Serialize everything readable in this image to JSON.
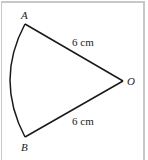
{
  "diagram": {
    "type": "sector",
    "points": {
      "A": "A",
      "O": "O",
      "B": "B"
    },
    "labels": {
      "OA_length": "6 cm",
      "OB_length": "6 cm"
    },
    "colors": {
      "stroke": "#1a1a1a",
      "frame": "#c8c8c8"
    }
  }
}
